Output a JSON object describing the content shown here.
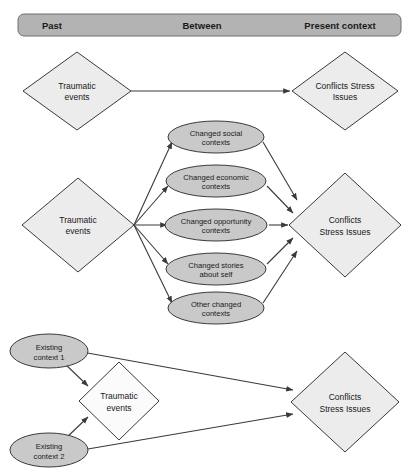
{
  "diagram": {
    "colors": {
      "header_fill": "#b3b3b3",
      "header_stroke": "#6e6e6e",
      "diamond_fill": "#ececec",
      "diamond_fill_light": "#fbfbfb",
      "ellipse_fill": "#c9c9c9",
      "stroke": "#3a3a3a",
      "text": "#1a1a1a",
      "background": "#ffffff"
    },
    "header": {
      "columns": [
        {
          "id": "past",
          "label": "Past"
        },
        {
          "id": "between",
          "label": "Between"
        },
        {
          "id": "present",
          "label": "Present context"
        }
      ]
    },
    "rows": [
      {
        "id": "row-1",
        "nodes": [
          {
            "id": "r1-trauma",
            "shape": "diamond",
            "lines": [
              "Traumatic",
              "events"
            ]
          },
          {
            "id": "r1-conflicts",
            "shape": "diamond",
            "lines": [
              "Conflicts Stress",
              "Issues"
            ]
          }
        ],
        "edges": [
          {
            "from": "r1-trauma",
            "to": "r1-conflicts"
          }
        ]
      },
      {
        "id": "row-2",
        "nodes": [
          {
            "id": "r2-trauma",
            "shape": "diamond",
            "lines": [
              "Traumatic",
              "events"
            ]
          },
          {
            "id": "r2-e1",
            "shape": "ellipse",
            "lines": [
              "Changed social",
              "contexts"
            ]
          },
          {
            "id": "r2-e2",
            "shape": "ellipse",
            "lines": [
              "Changed economic",
              "contexts"
            ]
          },
          {
            "id": "r2-e3",
            "shape": "ellipse",
            "lines": [
              "Changed opportunity",
              "contexts"
            ]
          },
          {
            "id": "r2-e4",
            "shape": "ellipse",
            "lines": [
              "Changed stories",
              "about self"
            ]
          },
          {
            "id": "r2-e5",
            "shape": "ellipse",
            "lines": [
              "Other changed",
              "contexts"
            ]
          },
          {
            "id": "r2-conflicts",
            "shape": "diamond",
            "lines": [
              "Conflicts",
              "Stress Issues"
            ]
          }
        ],
        "edges": [
          {
            "from": "r2-trauma",
            "to": "r2-e1"
          },
          {
            "from": "r2-trauma",
            "to": "r2-e2"
          },
          {
            "from": "r2-trauma",
            "to": "r2-e3"
          },
          {
            "from": "r2-trauma",
            "to": "r2-e4"
          },
          {
            "from": "r2-trauma",
            "to": "r2-e5"
          },
          {
            "from": "r2-e1",
            "to": "r2-conflicts"
          },
          {
            "from": "r2-e2",
            "to": "r2-conflicts"
          },
          {
            "from": "r2-e3",
            "to": "r2-conflicts"
          },
          {
            "from": "r2-e4",
            "to": "r2-conflicts"
          },
          {
            "from": "r2-e5",
            "to": "r2-conflicts"
          }
        ]
      },
      {
        "id": "row-3",
        "nodes": [
          {
            "id": "r3-ctx1",
            "shape": "ellipse",
            "lines": [
              "Existing",
              "context 1"
            ]
          },
          {
            "id": "r3-ctx2",
            "shape": "ellipse",
            "lines": [
              "Existing",
              "context 2"
            ]
          },
          {
            "id": "r3-trauma",
            "shape": "diamond",
            "lines": [
              "Traumatic",
              "events"
            ]
          },
          {
            "id": "r3-conflicts",
            "shape": "diamond",
            "lines": [
              "Conflicts",
              "Stress Issues"
            ]
          }
        ],
        "edges": [
          {
            "from": "r3-ctx1",
            "to": "r3-trauma"
          },
          {
            "from": "r3-ctx2",
            "to": "r3-trauma"
          },
          {
            "from": "r3-ctx1",
            "to": "r3-conflicts"
          },
          {
            "from": "r3-ctx2",
            "to": "r3-conflicts"
          }
        ]
      }
    ]
  }
}
